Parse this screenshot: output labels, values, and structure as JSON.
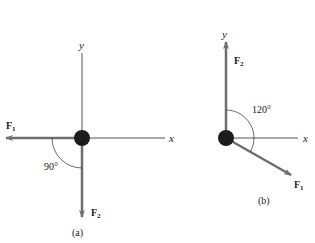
{
  "figure": {
    "panels": [
      {
        "id": "a",
        "caption": "(a)",
        "axes": {
          "x_label": "x",
          "y_label": "y"
        },
        "forces": [
          {
            "name": "F",
            "subscript": "1",
            "direction": "negative x (left)"
          },
          {
            "name": "F",
            "subscript": "2",
            "direction": "negative y (down)"
          }
        ],
        "angle_label": "90°"
      },
      {
        "id": "b",
        "caption": "(b)",
        "axes": {
          "x_label": "x",
          "y_label": "y"
        },
        "forces": [
          {
            "name": "F",
            "subscript": "2",
            "direction": "positive y (up)"
          },
          {
            "name": "F",
            "subscript": "1",
            "direction": "30° below positive x"
          }
        ],
        "angle_label": "120°"
      }
    ],
    "colors": {
      "axis": "#555555",
      "force_arrow": "#6e6e6e",
      "particle": "#1c1c1c",
      "arc": "#444444"
    }
  }
}
